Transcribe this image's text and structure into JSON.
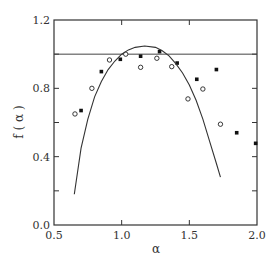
{
  "chart_data": {
    "type": "scatter",
    "title": "",
    "xlabel": "α",
    "ylabel": "f ( α )",
    "xlim": [
      0.5,
      2.0
    ],
    "ylim": [
      0.0,
      1.2
    ],
    "x_ticks": [
      0.5,
      1.0,
      1.5,
      2.0
    ],
    "x_tick_labels": [
      "0.5",
      "1.0",
      "1.5",
      "2.0"
    ],
    "y_ticks": [
      0.0,
      0.2,
      0.4,
      0.6,
      0.8,
      1.0,
      1.2
    ],
    "y_tick_labels": [
      "0.0",
      "",
      "0.4",
      "",
      "0.8",
      "",
      "1.2"
    ],
    "grid": false,
    "legend": "none",
    "reference_line": {
      "y": 1.0
    },
    "series": [
      {
        "name": "open circles",
        "marker": "open-circle",
        "x": [
          0.655,
          0.78,
          0.91,
          1.03,
          1.14,
          1.26,
          1.37,
          1.49,
          1.6,
          1.73
        ],
        "y": [
          0.65,
          0.8,
          0.966,
          1.0,
          0.923,
          0.976,
          0.927,
          0.738,
          0.796,
          0.59
        ]
      },
      {
        "name": "filled squares",
        "marker": "filled-square",
        "x": [
          0.7,
          0.85,
          0.99,
          1.14,
          1.28,
          1.41,
          1.555,
          1.7,
          1.85,
          1.99
        ],
        "y": [
          0.67,
          0.898,
          0.97,
          0.988,
          1.015,
          0.948,
          0.853,
          0.91,
          0.54,
          0.478
        ]
      },
      {
        "name": "fit curve",
        "marker": "line",
        "x": [
          0.65,
          0.7,
          0.75,
          0.8,
          0.85,
          0.9,
          0.95,
          1.0,
          1.05,
          1.1,
          1.17,
          1.25,
          1.3,
          1.35,
          1.4,
          1.45,
          1.5,
          1.55,
          1.6,
          1.65,
          1.7,
          1.73
        ],
        "y": [
          0.18,
          0.45,
          0.62,
          0.75,
          0.84,
          0.91,
          0.96,
          1.0,
          1.025,
          1.04,
          1.048,
          1.04,
          1.02,
          0.99,
          0.945,
          0.89,
          0.82,
          0.73,
          0.62,
          0.49,
          0.36,
          0.28
        ]
      }
    ]
  }
}
